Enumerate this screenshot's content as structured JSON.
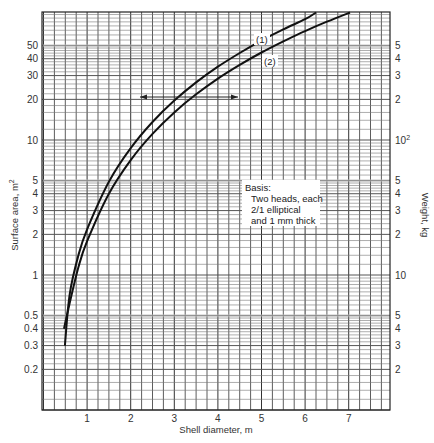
{
  "chart_data": {
    "type": "line",
    "title": "",
    "xlabel": "Shell diameter, m",
    "ylabel": "Surface area, m²",
    "ylabel_left_base": "Surface area, m",
    "ylabel_left_sup": "2",
    "y2label": "Weight, kg",
    "xlim": [
      0,
      8
    ],
    "ylim": [
      0.1,
      90
    ],
    "yscale": "log",
    "grid": true,
    "x_ticks": [
      "1",
      "2",
      "3",
      "4",
      "5",
      "6",
      "7"
    ],
    "x_tick_values": [
      1,
      2,
      3,
      4,
      5,
      6,
      7
    ],
    "y_ticks_left": [
      {
        "value": 50,
        "label": "50"
      },
      {
        "value": 40,
        "label": "40"
      },
      {
        "value": 30,
        "label": "30"
      },
      {
        "value": 20,
        "label": "20"
      },
      {
        "value": 10,
        "label": "10"
      },
      {
        "value": 5,
        "label": "5"
      },
      {
        "value": 4,
        "label": "4"
      },
      {
        "value": 3,
        "label": "3"
      },
      {
        "value": 2,
        "label": "2"
      },
      {
        "value": 1,
        "label": "1"
      },
      {
        "value": 0.5,
        "label": "0.5"
      },
      {
        "value": 0.4,
        "label": "0.4"
      },
      {
        "value": 0.3,
        "label": "0.3"
      },
      {
        "value": 0.2,
        "label": "0.2"
      }
    ],
    "y_ticks_right": [
      {
        "value": 50,
        "label": "5"
      },
      {
        "value": 40,
        "label": "4"
      },
      {
        "value": 30,
        "label": "3"
      },
      {
        "value": 20,
        "label": "2"
      },
      {
        "value": 10,
        "label": "10",
        "sup": "2"
      },
      {
        "value": 5,
        "label": "5"
      },
      {
        "value": 4,
        "label": "4"
      },
      {
        "value": 3,
        "label": "3"
      },
      {
        "value": 2,
        "label": "2"
      },
      {
        "value": 1,
        "label": "10"
      },
      {
        "value": 0.5,
        "label": "5"
      },
      {
        "value": 0.4,
        "label": "4"
      },
      {
        "value": 0.3,
        "label": "3"
      },
      {
        "value": 0.2,
        "label": "2"
      }
    ],
    "series": [
      {
        "name": "(1)",
        "label": "(1)",
        "x": [
          0.49,
          0.6,
          0.8,
          1.0,
          1.5,
          2.0,
          2.5,
          3.0,
          3.5,
          4.0,
          4.5,
          5.0,
          5.5,
          6.0,
          6.25
        ],
        "values": [
          0.3,
          0.72,
          1.4,
          2.18,
          4.9,
          8.7,
          13.6,
          19.6,
          26.7,
          34.9,
          44.1,
          54.5,
          66.0,
          78.5,
          88.0
        ]
      },
      {
        "name": "(2)",
        "label": "(2)",
        "x": [
          0.47,
          0.6,
          0.8,
          1.0,
          1.5,
          2.0,
          2.5,
          3.0,
          3.5,
          4.0,
          4.5,
          5.0,
          5.5,
          6.0,
          6.5,
          7.03
        ],
        "values": [
          0.4,
          0.62,
          1.14,
          1.78,
          4.0,
          7.1,
          11.1,
          16.0,
          21.8,
          28.5,
          36.0,
          44.5,
          53.8,
          64.1,
          75.2,
          88.0
        ]
      }
    ],
    "annotations": [
      {
        "type": "text",
        "lines": [
          "Basis:",
          "Two heads, each",
          "2/1 elliptical",
          "and 1 mm thick"
        ]
      },
      {
        "type": "double-arrow",
        "y": 21,
        "x_from": 2.2,
        "x_to": 4.5
      },
      {
        "type": "curve-label",
        "text": "(1)",
        "x": 4.95,
        "y": 58
      },
      {
        "type": "curve-label",
        "text": "(2)",
        "x": 5.25,
        "y": 40
      }
    ],
    "legend": "none"
  },
  "labels": {
    "xlabel": "Shell diameter, m",
    "y2label": "Weight, kg",
    "basis_title": "Basis:",
    "basis_line1": "Two heads, each",
    "basis_line2": "2/1 elliptical",
    "basis_line3": "and 1 mm thick",
    "curve1": "(1)",
    "curve2": "(2)"
  }
}
